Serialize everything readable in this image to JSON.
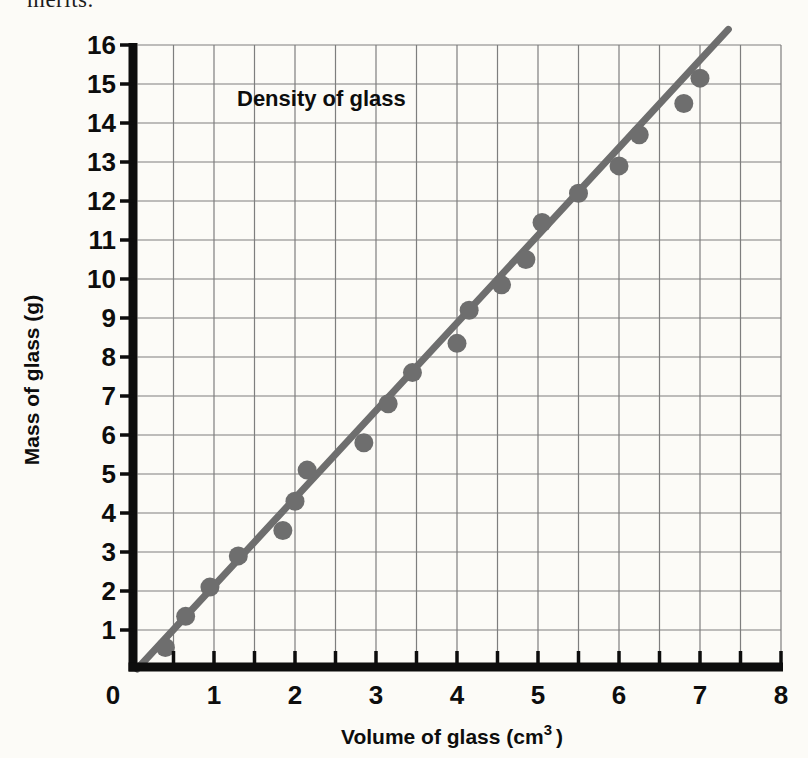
{
  "page": {
    "cropped_top_text": "merits.",
    "background_color": "#fcfbf7"
  },
  "chart_data": {
    "type": "scatter",
    "title": "Density of glass",
    "xlabel": "Volume of glass (cm³ )",
    "xlabel_parts": {
      "prefix": "Volume of glass (cm",
      "superscript": "3",
      "suffix": ")"
    },
    "ylabel": "Mass of glass (g)",
    "xlim": [
      0,
      8
    ],
    "ylim": [
      0,
      16
    ],
    "x_minor_tick_step": 0.5,
    "x_label_step": 1,
    "y_tick_step": 1,
    "grid": true,
    "x_tick_labels": [
      "0",
      "1",
      "2",
      "3",
      "4",
      "5",
      "6",
      "7",
      "8"
    ],
    "y_tick_labels": [
      "1",
      "2",
      "3",
      "4",
      "5",
      "6",
      "7",
      "8",
      "9",
      "10",
      "11",
      "12",
      "13",
      "14",
      "15",
      "16"
    ],
    "points": [
      [
        0.4,
        0.55
      ],
      [
        0.65,
        1.35
      ],
      [
        0.95,
        2.1
      ],
      [
        1.3,
        2.9
      ],
      [
        1.85,
        3.55
      ],
      [
        2.0,
        4.3
      ],
      [
        2.15,
        5.1
      ],
      [
        2.85,
        5.8
      ],
      [
        3.15,
        6.8
      ],
      [
        3.45,
        7.6
      ],
      [
        4.0,
        8.35
      ],
      [
        4.15,
        9.2
      ],
      [
        4.55,
        9.85
      ],
      [
        4.85,
        10.5
      ],
      [
        5.05,
        11.45
      ],
      [
        5.5,
        12.2
      ],
      [
        6.0,
        12.9
      ],
      [
        6.25,
        13.7
      ],
      [
        6.8,
        14.5
      ],
      [
        7.0,
        15.15
      ]
    ],
    "best_fit_line": {
      "x1": 0.05,
      "y1": 0.0,
      "x2": 7.35,
      "y2": 16.4
    },
    "colors": {
      "data_gray": "#6e6e6e",
      "grid_gray": "#7e7e7e",
      "axis_black": "#0d0d0d"
    }
  }
}
